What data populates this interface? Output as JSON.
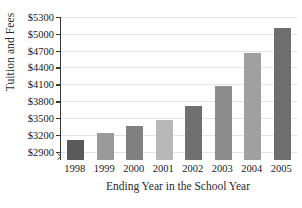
{
  "chart_data": {
    "type": "bar",
    "title": "",
    "xlabel": "Ending Year in the School Year",
    "ylabel": "Tuition and Fees",
    "categories": [
      "1998",
      "1999",
      "2000",
      "2001",
      "2002",
      "2003",
      "2004",
      "2005"
    ],
    "values": [
      3100,
      3240,
      3350,
      3470,
      3720,
      4070,
      4660,
      5100
    ],
    "ylim": [
      2750,
      5300
    ],
    "ytick_values": [
      2900,
      3200,
      3500,
      3800,
      4100,
      4400,
      4700,
      5000,
      5300
    ],
    "ytick_labels": [
      "$2900",
      "$3200",
      "$3500",
      "$3800",
      "$4100",
      "$4400",
      "$4700",
      "$5000",
      "$5300"
    ],
    "grid": true,
    "legend": false,
    "axis_break": true,
    "bar_colors": [
      "#5a5a5a",
      "#9a9a9a",
      "#808080",
      "#b8b8b8",
      "#707070",
      "#8c8c8c",
      "#a0a0a0",
      "#6e6e6e"
    ]
  },
  "axes": {
    "y_title": "Tuition and Fees",
    "x_title": "Ending Year in the School Year"
  },
  "colors": {
    "gridline": "#e4e4e4",
    "axis": "#3a3a3a",
    "text": "#1a1a1a",
    "background": "#ffffff"
  }
}
